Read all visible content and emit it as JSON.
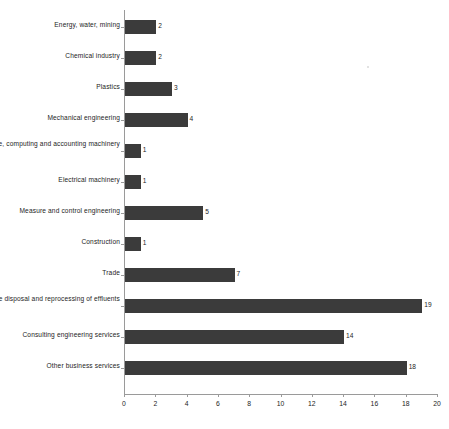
{
  "chart_data": {
    "type": "bar",
    "orientation": "horizontal",
    "title": "",
    "subtitle": "",
    "xlabel": "",
    "ylabel": "",
    "xlim": [
      0,
      20
    ],
    "xticks": [
      0,
      2,
      4,
      6,
      8,
      10,
      12,
      14,
      16,
      18,
      20
    ],
    "grid": false,
    "legend": null,
    "bar_color": "#3b3b3b",
    "axis_color": "#9a9a9a",
    "text_color": "#1d1d1d",
    "show_value_labels": true,
    "categories": [
      "Energy, water, mining",
      "Chemical industry",
      "Plastics",
      "Mechanical engineering",
      "Office, computing and accounting machinery",
      "Electrical machinery",
      "Measure and control engineering",
      "Construction",
      "Trade",
      "Services: waste disposal and reprocessing of effluents",
      "Consulting engineering services",
      "Other business services"
    ],
    "values": [
      2,
      2,
      3,
      4,
      1,
      1,
      5,
      1,
      7,
      19,
      14,
      18
    ]
  }
}
